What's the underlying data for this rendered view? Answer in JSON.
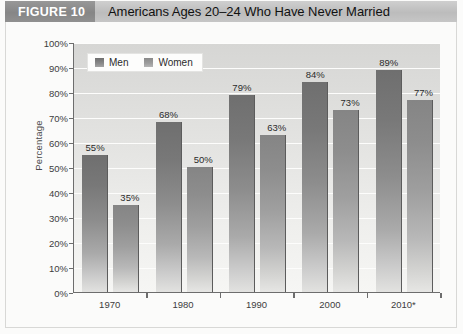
{
  "figure": {
    "tag": "FIGURE 10",
    "title": "Americans Ages 20–24 Who Have Never Married"
  },
  "legend": {
    "position": "top-left",
    "items": [
      {
        "label": "Men",
        "swatch": "men-swatch",
        "color": "#7d7d7d"
      },
      {
        "label": "Women",
        "swatch": "women-swatch",
        "color": "#9b9b9b"
      }
    ]
  },
  "chart_data": {
    "type": "bar",
    "title": "Americans Ages 20–24 Who Have Never Married",
    "xlabel": "",
    "ylabel": "Percentage",
    "categories": [
      "1970",
      "1980",
      "1990",
      "2000",
      "2010*"
    ],
    "series": [
      {
        "name": "Men",
        "values": [
          55,
          68,
          79,
          84,
          89
        ],
        "color": "#7d7d7d"
      },
      {
        "name": "Women",
        "values": [
          35,
          50,
          63,
          73,
          77
        ],
        "color": "#9b9b9b"
      }
    ],
    "value_labels": [
      [
        "55%",
        "35%"
      ],
      [
        "68%",
        "50%"
      ],
      [
        "79%",
        "63%"
      ],
      [
        "84%",
        "73%"
      ],
      [
        "89%",
        "77%"
      ]
    ],
    "ylim": [
      0,
      100
    ],
    "ytick_values": [
      0,
      10,
      20,
      30,
      40,
      50,
      60,
      70,
      80,
      90,
      100
    ],
    "ytick_labels": [
      "0%",
      "10%",
      "20%",
      "30%",
      "40%",
      "50%",
      "60%",
      "70%",
      "80%",
      "90%",
      "100%"
    ],
    "grid": "horizontal",
    "legend_position": "top-left",
    "plot_background": "#e4e4e2"
  }
}
